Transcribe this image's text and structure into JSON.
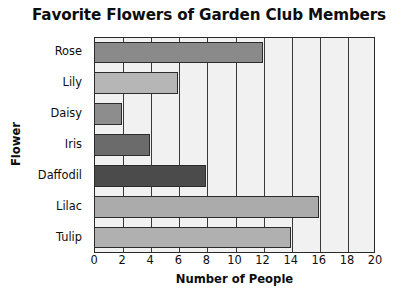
{
  "chart_data": {
    "type": "bar",
    "orientation": "horizontal",
    "title": "Favorite Flowers of Garden Club Members",
    "xlabel": "Number of People",
    "ylabel": "Flower",
    "categories": [
      "Rose",
      "Lily",
      "Daisy",
      "Iris",
      "Daffodil",
      "Lilac",
      "Tulip"
    ],
    "values": [
      12,
      6,
      2,
      4,
      8,
      16,
      14
    ],
    "bar_colors": [
      "#8a8a8a",
      "#b6b6b6",
      "#8d8d8d",
      "#6b6b6b",
      "#4b4b4b",
      "#ababab",
      "#b0b0b0"
    ],
    "xlim": [
      0,
      20
    ],
    "xticks": [
      0,
      2,
      4,
      6,
      8,
      10,
      12,
      14,
      16,
      18,
      20
    ],
    "xtick_labels": [
      "0",
      "2",
      "4",
      "6",
      "8",
      "10",
      "12",
      "14",
      "16",
      "18",
      "20"
    ],
    "grid": "vertical",
    "legend": "none",
    "plot_background": "#f1f1f1",
    "axis_color": "#2a2a2a",
    "gridline_color": "#3a3a3a",
    "bar_edge_color": "#2c2c2c"
  }
}
